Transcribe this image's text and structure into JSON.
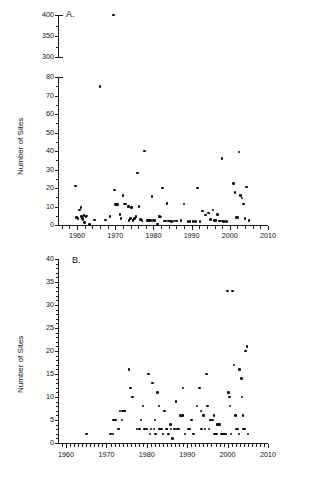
{
  "figure": {
    "panels": [
      {
        "letter": "A.",
        "y_axis_title": "Number of Sites",
        "y_lower_ticks": [
          "0",
          "10",
          "20",
          "30",
          "40",
          "50",
          "60",
          "70",
          "80"
        ],
        "y_upper_ticks": [
          "300",
          "350",
          "400"
        ],
        "x_ticks": [
          "1960",
          "1970",
          "1980",
          "1990",
          "2000",
          "2010"
        ]
      },
      {
        "letter": "B.",
        "y_axis_title": "Number of Sites",
        "y_ticks": [
          "0",
          "5",
          "10",
          "15",
          "20",
          "25",
          "30",
          "35",
          "40"
        ],
        "x_ticks": [
          "1960",
          "1970",
          "1980",
          "1990",
          "2000",
          "2010"
        ]
      }
    ]
  },
  "chart_data": [
    {
      "type": "scatter",
      "panel": "A",
      "title": "",
      "xlabel": "",
      "ylabel": "Number of Sites",
      "xlim": [
        1955,
        2010
      ],
      "ylim_lower": [
        0,
        80
      ],
      "ylim_upper": [
        300,
        400
      ],
      "broken_y_axis": true,
      "break_between": [
        80,
        300
      ],
      "grid": false,
      "legend": "none",
      "marker": "filled-circle",
      "color": "#0a0a0a",
      "points": [
        [
          1959.6,
          21
        ],
        [
          1959.8,
          4
        ],
        [
          1960.2,
          3.5
        ],
        [
          1960.6,
          8
        ],
        [
          1961.0,
          9.5
        ],
        [
          1961.2,
          4.5
        ],
        [
          1961.4,
          3.5
        ],
        [
          1961.5,
          2.6
        ],
        [
          1961.8,
          5
        ],
        [
          1962.0,
          1.5
        ],
        [
          1962.3,
          4.5
        ],
        [
          1962.6,
          4.8
        ],
        [
          1963.2,
          0.4
        ],
        [
          1964.6,
          2.7
        ],
        [
          1966.0,
          75
        ],
        [
          1967.4,
          2.6
        ],
        [
          1968.6,
          4.5
        ],
        [
          1969.6,
          400
        ],
        [
          1969.8,
          19
        ],
        [
          1970.0,
          11
        ],
        [
          1970.3,
          11
        ],
        [
          1970.6,
          11
        ],
        [
          1971.2,
          5.7
        ],
        [
          1971.5,
          3.5
        ],
        [
          1972.0,
          16
        ],
        [
          1972.4,
          11.3
        ],
        [
          1972.8,
          11.3
        ],
        [
          1973.4,
          10
        ],
        [
          1973.6,
          2.5
        ],
        [
          1974.0,
          3.5
        ],
        [
          1974.3,
          9.6
        ],
        [
          1974.6,
          2.5
        ],
        [
          1975.0,
          3.5
        ],
        [
          1975.4,
          4.5
        ],
        [
          1975.8,
          28
        ],
        [
          1976.2,
          10
        ],
        [
          1976.6,
          3.0
        ],
        [
          1977.0,
          2.3
        ],
        [
          1977.6,
          40
        ],
        [
          1978.4,
          2.3
        ],
        [
          1978.8,
          2.3
        ],
        [
          1979.2,
          2.3
        ],
        [
          1979.6,
          15.5
        ],
        [
          1980.0,
          2.3
        ],
        [
          1980.4,
          2.3
        ],
        [
          1981.0,
          0.5
        ],
        [
          1981.6,
          4.5
        ],
        [
          1982.0,
          4.3
        ],
        [
          1982.4,
          20
        ],
        [
          1982.8,
          2.2
        ],
        [
          1983.2,
          2.2
        ],
        [
          1983.6,
          11.5
        ],
        [
          1984.0,
          2.2
        ],
        [
          1984.4,
          2.2
        ],
        [
          1984.8,
          1.8
        ],
        [
          1985.4,
          2.2
        ],
        [
          1986.0,
          2.2
        ],
        [
          1987.2,
          2.3
        ],
        [
          1988.0,
          11.3
        ],
        [
          1989.0,
          2.0
        ],
        [
          1989.6,
          1.8
        ],
        [
          1990.4,
          2.0
        ],
        [
          1991.0,
          2.0
        ],
        [
          1991.6,
          20
        ],
        [
          1992.2,
          1.8
        ],
        [
          1992.8,
          7.5
        ],
        [
          1993.6,
          5.5
        ],
        [
          1994.4,
          6.5
        ],
        [
          1995.0,
          3.0
        ],
        [
          1995.6,
          8.0
        ],
        [
          1996.0,
          2.3
        ],
        [
          1996.4,
          2.3
        ],
        [
          1996.8,
          5.8
        ],
        [
          1997.2,
          2.2
        ],
        [
          1997.6,
          2.2
        ],
        [
          1998.0,
          36
        ],
        [
          1998.4,
          1.8
        ],
        [
          1999.2,
          1.8
        ],
        [
          2001.0,
          22.5
        ],
        [
          2001.4,
          17.5
        ],
        [
          2001.8,
          4.0
        ],
        [
          2002.0,
          4.0
        ],
        [
          2002.4,
          39.5
        ],
        [
          2002.8,
          16
        ],
        [
          2003.2,
          14.5
        ],
        [
          2003.6,
          11.3
        ],
        [
          2004.0,
          3.5
        ],
        [
          2004.4,
          20.5
        ],
        [
          2005.0,
          2.5
        ]
      ]
    },
    {
      "type": "scatter",
      "panel": "B",
      "title": "",
      "xlabel": "",
      "ylabel": "Number of Sites",
      "xlim": [
        1958,
        2010
      ],
      "ylim": [
        0,
        40
      ],
      "grid": false,
      "legend": "none",
      "marker": "filled-circle",
      "color": "#0a0a0a",
      "points": [
        [
          1965.0,
          2
        ],
        [
          1971.0,
          2
        ],
        [
          1971.6,
          2
        ],
        [
          1971.8,
          5
        ],
        [
          1972.2,
          5
        ],
        [
          1973.0,
          3
        ],
        [
          1973.4,
          7
        ],
        [
          1973.8,
          5
        ],
        [
          1974.0,
          7
        ],
        [
          1974.4,
          7
        ],
        [
          1974.6,
          7
        ],
        [
          1975.6,
          16
        ],
        [
          1976.0,
          12
        ],
        [
          1976.4,
          10
        ],
        [
          1977.6,
          3
        ],
        [
          1978.2,
          3
        ],
        [
          1978.6,
          5
        ],
        [
          1979.0,
          8
        ],
        [
          1979.4,
          3
        ],
        [
          1979.8,
          3
        ],
        [
          1980.0,
          3
        ],
        [
          1980.4,
          15
        ],
        [
          1980.8,
          2
        ],
        [
          1981.0,
          3
        ],
        [
          1981.4,
          13
        ],
        [
          1981.8,
          3
        ],
        [
          1982.0,
          5
        ],
        [
          1982.2,
          2
        ],
        [
          1982.6,
          11
        ],
        [
          1983.0,
          8
        ],
        [
          1983.2,
          3
        ],
        [
          1983.6,
          3
        ],
        [
          1984.0,
          2
        ],
        [
          1984.4,
          7
        ],
        [
          1984.8,
          3
        ],
        [
          1985.0,
          3
        ],
        [
          1985.4,
          2
        ],
        [
          1985.8,
          4
        ],
        [
          1986.0,
          3
        ],
        [
          1986.4,
          1
        ],
        [
          1986.8,
          3
        ],
        [
          1987.2,
          9
        ],
        [
          1987.6,
          3
        ],
        [
          1988.0,
          3
        ],
        [
          1988.4,
          6
        ],
        [
          1988.8,
          6
        ],
        [
          1989.0,
          12
        ],
        [
          1989.4,
          2
        ],
        [
          1990.2,
          3
        ],
        [
          1990.6,
          3
        ],
        [
          1991.0,
          5
        ],
        [
          1991.6,
          2
        ],
        [
          1992.4,
          8
        ],
        [
          1993.0,
          12
        ],
        [
          1993.4,
          7
        ],
        [
          1993.6,
          3
        ],
        [
          1994.0,
          6
        ],
        [
          1994.4,
          3
        ],
        [
          1994.8,
          15
        ],
        [
          1995.0,
          8
        ],
        [
          1995.4,
          3
        ],
        [
          1995.8,
          5
        ],
        [
          1996.0,
          5
        ],
        [
          1996.4,
          5
        ],
        [
          1996.6,
          6
        ],
        [
          1996.8,
          2
        ],
        [
          1997.0,
          2
        ],
        [
          1997.2,
          2
        ],
        [
          1997.4,
          4
        ],
        [
          1997.8,
          4
        ],
        [
          1998.0,
          4
        ],
        [
          1998.4,
          2
        ],
        [
          1998.8,
          2
        ],
        [
          1999.2,
          2
        ],
        [
          1999.6,
          2
        ],
        [
          2000.0,
          33
        ],
        [
          2000.2,
          11
        ],
        [
          2000.4,
          10
        ],
        [
          2000.6,
          8
        ],
        [
          2000.8,
          2
        ],
        [
          2001.2,
          33
        ],
        [
          2001.6,
          17
        ],
        [
          2002.0,
          6
        ],
        [
          2002.2,
          3
        ],
        [
          2002.6,
          3
        ],
        [
          2002.8,
          2
        ],
        [
          2003.0,
          16
        ],
        [
          2003.4,
          14
        ],
        [
          2003.6,
          10
        ],
        [
          2003.8,
          6
        ],
        [
          2004.0,
          3
        ],
        [
          2004.2,
          3
        ],
        [
          2004.4,
          20
        ],
        [
          2004.8,
          21
        ],
        [
          2005.0,
          2
        ]
      ]
    }
  ]
}
